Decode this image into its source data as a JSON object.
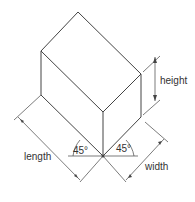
{
  "diagram": {
    "labels": {
      "height": "height",
      "length": "length",
      "width": "width",
      "angle_left": "45°",
      "angle_right": "45°"
    },
    "colors": {
      "line": "#444444",
      "text": "#333333",
      "background": "#ffffff"
    }
  }
}
